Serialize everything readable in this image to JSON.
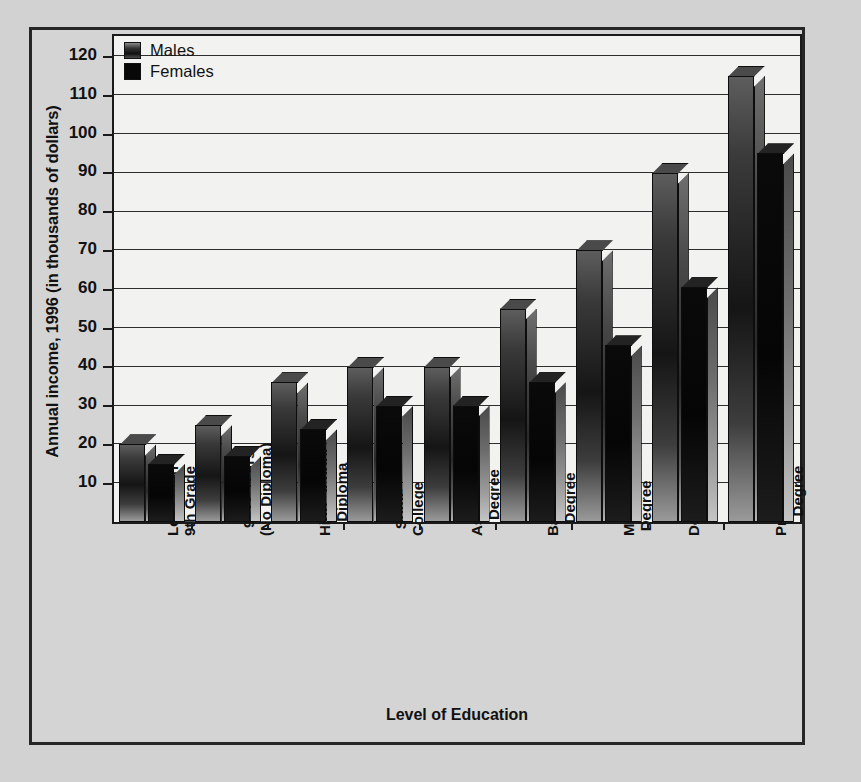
{
  "chart_data": {
    "type": "bar",
    "title": "",
    "xlabel": "Level of Education",
    "ylabel": "Annual income, 1996 (in thousands of dollars)",
    "ylim": [
      0,
      125
    ],
    "yticks": [
      10,
      20,
      30,
      40,
      50,
      60,
      70,
      80,
      90,
      100,
      110,
      120
    ],
    "ytick_labels": [
      "10",
      "20",
      "30",
      "40",
      "50",
      "60",
      "70",
      "80",
      "90",
      "100",
      "110",
      "120"
    ],
    "grid": true,
    "legend_position": "top-left",
    "categories": [
      "Less than 9th Grade",
      "9–12 Years (No Diploma)",
      "High School Diploma",
      "Some College",
      "Associate's Degree",
      "Bachelor's Degree",
      "Master's Degree",
      "Doctorate",
      "Professional Degree"
    ],
    "category_lines": [
      [
        "Less than",
        "9th Grade"
      ],
      [
        "9–12 Years",
        "(No Diploma)"
      ],
      [
        "High School",
        "Diploma"
      ],
      [
        "Some",
        "College"
      ],
      [
        "Associate's",
        "Degree"
      ],
      [
        "Bachelor's",
        "Degree"
      ],
      [
        "Master's",
        "Degree"
      ],
      [
        "Doctorate"
      ],
      [
        "Professional",
        "Degree"
      ]
    ],
    "series": [
      {
        "name": "Males",
        "values": [
          20,
          25,
          36,
          40,
          40,
          55,
          70,
          90,
          115
        ]
      },
      {
        "name": "Females",
        "values": [
          15,
          17,
          24,
          30,
          30,
          36,
          45.5,
          60.5,
          95
        ]
      }
    ]
  },
  "legend": {
    "items": [
      {
        "label": "Males",
        "swatch": "gradient-grey-swatch"
      },
      {
        "label": "Females",
        "swatch": "solid-black-swatch"
      }
    ]
  },
  "colors": {
    "page_background": "#d2d2d2",
    "panel_background": "#d4d4d4",
    "plot_background": "#f2f2f0",
    "axis": "#1a1a1a",
    "gridline": "#2e2e2e",
    "text": "#111111",
    "males_bar": "#3a3a3a",
    "females_bar": "#080808"
  }
}
